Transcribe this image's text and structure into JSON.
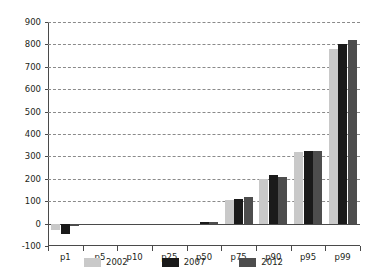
{
  "chart_data": {
    "type": "bar",
    "title": "",
    "subtitle": "",
    "xlabel": "",
    "ylabel": "",
    "categories": [
      "p1",
      "p5",
      "p10",
      "p25",
      "p50",
      "p75",
      "p90",
      "p95",
      "p99"
    ],
    "series": [
      {
        "name": "2002",
        "color": "#c9c9c9",
        "values": [
          -30,
          0,
          0,
          0,
          0,
          105,
          200,
          320,
          780
        ]
      },
      {
        "name": "2007",
        "color": "#1a1a1a",
        "values": [
          -45,
          0,
          0,
          0,
          8,
          110,
          215,
          325,
          800
        ]
      },
      {
        "name": "2012",
        "color": "#4d4d4d",
        "values": [
          -10,
          0,
          0,
          0,
          5,
          120,
          210,
          325,
          820
        ]
      }
    ],
    "ylim": [
      -100,
      900
    ],
    "yticks": [
      -100,
      0,
      100,
      200,
      300,
      400,
      500,
      600,
      700,
      800,
      900
    ],
    "ytick_labels": [
      "-100",
      "0",
      "100",
      "200",
      "300",
      "400",
      "500",
      "600",
      "700",
      "800",
      "900"
    ],
    "grid": true,
    "grid_style": "dashed",
    "legend_position": "bottom"
  },
  "legend": {
    "items": [
      {
        "label": "2002",
        "color": "#c9c9c9"
      },
      {
        "label": "2007",
        "color": "#1a1a1a"
      },
      {
        "label": "2012",
        "color": "#4d4d4d"
      }
    ]
  },
  "axes": {
    "y_axis_name": "y-axis",
    "x_axis_name": "x-axis"
  }
}
